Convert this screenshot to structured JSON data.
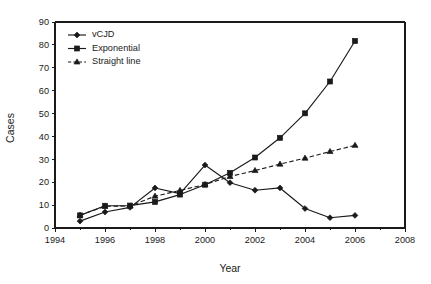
{
  "chart_data": {
    "type": "line",
    "title": "",
    "xlabel": "Year",
    "ylabel": "Cases",
    "xlim": [
      1994,
      2008
    ],
    "ylim": [
      0,
      90
    ],
    "grid": false,
    "legend_position": "top-left",
    "x": [
      1995,
      1996,
      1997,
      1998,
      1999,
      2000,
      2001,
      2002,
      2003,
      2004,
      2005,
      2006
    ],
    "xticks": [
      1994,
      1996,
      1998,
      2000,
      2002,
      2004,
      2006,
      2008
    ],
    "xticklabels": [
      "1994",
      "1996",
      "1998",
      "2000",
      "2002",
      "2004",
      "2006",
      "2008"
    ],
    "x_minor_ticks": [
      1995,
      1997,
      1999,
      2001,
      2003,
      2005,
      2007
    ],
    "yticks": [
      0,
      10,
      20,
      30,
      40,
      50,
      60,
      70,
      80,
      90
    ],
    "yticklabels": [
      "0",
      "10",
      "20",
      "30",
      "40",
      "50",
      "60",
      "70",
      "80",
      "90"
    ],
    "series": [
      {
        "name": "vCJD",
        "marker": "diamond",
        "linestyle": "solid",
        "color": "#1a1a1a",
        "values": [
          3.0,
          7.0,
          9.0,
          17.5,
          15.0,
          27.5,
          19.8,
          16.5,
          17.5,
          8.5,
          4.5,
          5.5
        ]
      },
      {
        "name": "Exponential",
        "marker": "square",
        "linestyle": "solid",
        "color": "#1a1a1a",
        "values": [
          5.5,
          9.7,
          9.8,
          11.4,
          14.6,
          18.9,
          24.1,
          30.8,
          39.4,
          50.1,
          64.0,
          81.7
        ]
      },
      {
        "name": "Straight line",
        "marker": "triangle",
        "linestyle": "dashed",
        "color": "#1a1a1a",
        "values": [
          5.6,
          9.5,
          9.6,
          13.9,
          16.4,
          19.0,
          22.5,
          25.1,
          27.9,
          30.5,
          33.4,
          36.1
        ]
      }
    ]
  },
  "legend": {
    "entries": [
      {
        "label": "vCJD"
      },
      {
        "label": "Exponential"
      },
      {
        "label": "Straight line"
      }
    ]
  }
}
